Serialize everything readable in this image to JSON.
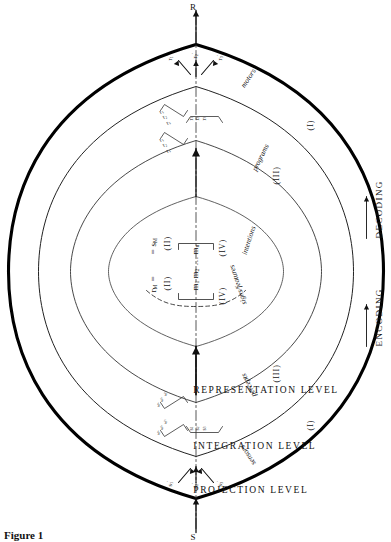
{
  "figure": {
    "caption": "Figure 1",
    "orientation_deg": -90
  },
  "endpoints": {
    "stimulus": "S",
    "response": "R"
  },
  "levels": [
    {
      "id": "projection",
      "label": "PROJECTION LEVEL"
    },
    {
      "id": "integration",
      "label": "INTEGRATION LEVEL"
    },
    {
      "id": "representation",
      "label": "REPRESENTATION LEVEL"
    }
  ],
  "axis": {
    "encoding_label": "ENCODING",
    "encoding_arrow": "→",
    "decoding_label": "DECODING",
    "decoding_arrow": "→"
  },
  "zones": {
    "input": {
      "transducer": "sensors",
      "stage": "percepts",
      "roman_inner": "(III)",
      "roman_outer": "(I)"
    },
    "output": {
      "transducer": "motors",
      "stage": "programs",
      "roman_inner": "(III)",
      "roman_outer": "(I)"
    }
  },
  "core": {
    "input_side": {
      "vector": "r",
      "vector_sub": "M",
      "relation": "=",
      "roman": "(II)",
      "bracket_roman": "(IV)",
      "stage_label": "signs/features"
    },
    "output_side": {
      "relation": "=",
      "vector": "s",
      "vector_sub": "M",
      "roman": "(II)",
      "bracket_roman": "(IV)",
      "stage_label": "intentions"
    },
    "memory_elements": {
      "items": [
        "m",
        "m",
        "m"
      ],
      "subs": [
        "1",
        "2",
        "n"
      ],
      "ellipsis": "···"
    }
  },
  "signal_groups": {
    "input_primed": {
      "items": [
        "s",
        "s",
        "s"
      ],
      "subs": [
        "1",
        "2",
        "3"
      ],
      "prime": "′"
    },
    "output_primed": {
      "items": [
        "r",
        "r",
        "r"
      ],
      "subs": [
        "1",
        "2",
        "3"
      ],
      "prime": "′"
    },
    "input_vectors": {
      "left": {
        "items": [
          "s",
          "s",
          "s"
        ],
        "subs": [
          "1",
          "2",
          "3"
        ]
      },
      "center": {
        "items": [
          "s",
          "s",
          "s"
        ],
        "subs": [
          "1",
          "2",
          "3"
        ]
      },
      "right": {
        "items": [
          "s",
          "s",
          "s"
        ],
        "subs": [
          "1",
          "2",
          "3"
        ]
      }
    },
    "output_vectors": {
      "left": {
        "items": [
          "r",
          "r",
          "r"
        ],
        "subs": [
          "1",
          "2",
          "3"
        ]
      },
      "center": {
        "items": [
          "r",
          "r",
          "r"
        ],
        "subs": [
          "1",
          "2",
          "3"
        ]
      },
      "right": {
        "items": [
          "r",
          "r",
          "r"
        ],
        "subs": [
          "1",
          "2",
          "3"
        ]
      }
    }
  },
  "colors": {
    "ink": "#111111",
    "outline": "#000000",
    "paper": "#ffffff"
  }
}
